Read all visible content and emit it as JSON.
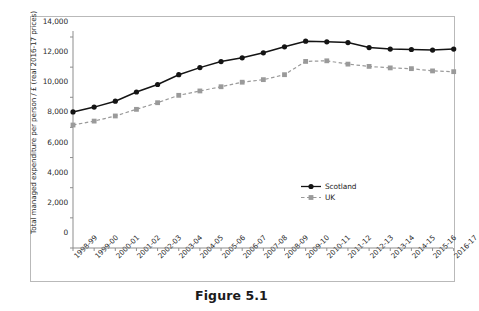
{
  "caption": "Figure 5.1",
  "legend": {
    "scotland": "Scotland",
    "uk": "UK"
  },
  "colors": {
    "scotland": "#141414",
    "uk": "#9a9a9a",
    "axis": "#8d8d8d",
    "frame": "#b9b9b9",
    "text": "#2b2b2b"
  },
  "chart_data": {
    "type": "line",
    "title": "",
    "xlabel": "",
    "ylabel": "Total managed expenditure per person / £ (real 2016-17 prices)",
    "ylim": [
      0,
      14000
    ],
    "yticks": [
      0,
      2000,
      4000,
      6000,
      8000,
      10000,
      12000,
      14000
    ],
    "ytick_labels": [
      "0",
      "2,000",
      "4,000",
      "6,000",
      "8,000",
      "10,000",
      "12,000",
      "14,000"
    ],
    "grid": false,
    "legend_position": "inside-right",
    "categories": [
      "1998-99",
      "1999-00",
      "2000-01",
      "2001-02",
      "2002-03",
      "2003-04",
      "2004-05",
      "2005-06",
      "2006-07",
      "2007-08",
      "2008-09",
      "2009-10",
      "2010-11",
      "2011-12",
      "2012-13",
      "2013-14",
      "2014-15",
      "2015-16",
      "2016-17"
    ],
    "series": [
      {
        "name": "Scotland",
        "style": "solid",
        "marker": "circle",
        "color": "#141414",
        "values": [
          9030,
          9350,
          9740,
          10350,
          10850,
          11500,
          11970,
          12370,
          12620,
          12950,
          13350,
          13720,
          13680,
          13630,
          13300,
          13200,
          13170,
          13130,
          13200
        ]
      },
      {
        "name": "UK",
        "style": "dashed",
        "marker": "square",
        "color": "#9a9a9a",
        "values": [
          8160,
          8420,
          8760,
          9200,
          9640,
          10130,
          10420,
          10700,
          11000,
          11170,
          11500,
          12380,
          12420,
          12200,
          12050,
          11950,
          11900,
          11750,
          11700
        ]
      }
    ]
  }
}
